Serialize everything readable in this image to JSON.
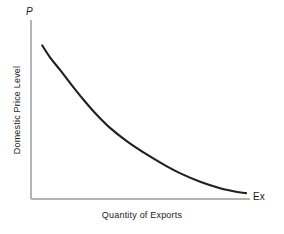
{
  "chart_data": {
    "type": "line",
    "title": "",
    "subtitle": "",
    "xlabel": "Quantity of Exports",
    "ylabel": "Domestic Price Level",
    "x_axis_symbol": "Ex",
    "y_axis_symbol": "P",
    "grid": false,
    "legend": null,
    "xlim": [
      0,
      1
    ],
    "ylim": [
      0,
      1
    ],
    "axis_color": "#b4b4b4",
    "curve_color": "#221f1f",
    "background_color": "#ffffff",
    "series": [
      {
        "name": "Export supply curve",
        "description": "Downward-sloping convex curve: domestic price level falls as quantity of exports rises",
        "points": [
          {
            "x": 0.052,
            "y": 0.888
          },
          {
            "x": 0.09,
            "y": 0.816
          },
          {
            "x": 0.137,
            "y": 0.743
          },
          {
            "x": 0.185,
            "y": 0.665
          },
          {
            "x": 0.232,
            "y": 0.592
          },
          {
            "x": 0.298,
            "y": 0.497
          },
          {
            "x": 0.365,
            "y": 0.414
          },
          {
            "x": 0.45,
            "y": 0.33
          },
          {
            "x": 0.54,
            "y": 0.256
          },
          {
            "x": 0.63,
            "y": 0.19
          },
          {
            "x": 0.7,
            "y": 0.145
          },
          {
            "x": 0.79,
            "y": 0.098
          },
          {
            "x": 0.88,
            "y": 0.062
          },
          {
            "x": 0.96,
            "y": 0.04
          },
          {
            "x": 1.0,
            "y": 0.034
          }
        ]
      }
    ],
    "annotations": []
  }
}
